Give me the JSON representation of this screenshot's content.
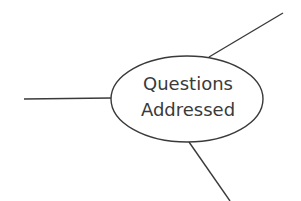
{
  "diagram": {
    "central_node": {
      "line1": "Questions",
      "line2": "Addressed"
    },
    "branches": [
      "left-branch",
      "upper-right-branch",
      "lower-branch"
    ],
    "colors": {
      "stroke": "#3a3a3a",
      "background": "#ffffff"
    }
  }
}
